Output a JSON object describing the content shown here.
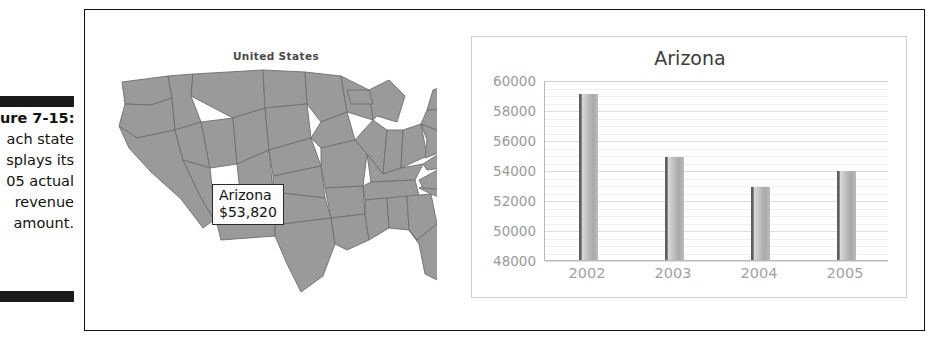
{
  "caption": {
    "lines": [
      "ure 7-15:",
      "ach state",
      "splays its",
      "05 actual",
      "revenue",
      "amount."
    ]
  },
  "map_panel": {
    "title": "United States",
    "callout": {
      "state": "Arizona",
      "value": "$53,820"
    },
    "fill_color": "#9a9a9a",
    "border_color": "#6e6e6e"
  },
  "chart_data": {
    "type": "bar",
    "title": "Arizona",
    "xlabel": "",
    "ylabel": "",
    "categories": [
      "2002",
      "2003",
      "2004",
      "2005"
    ],
    "values": [
      59100,
      54850,
      52850,
      53950
    ],
    "ylim": [
      48000,
      60000
    ],
    "yticks": [
      60000,
      58000,
      56000,
      54000,
      52000,
      50000,
      48000
    ],
    "ytick_labels": [
      "60000",
      "58000",
      "56000",
      "54000",
      "52000",
      "50000",
      "48000"
    ],
    "grid": true,
    "minor_grid_step": 500,
    "legend": "none",
    "bar_color": "#b4b4b4",
    "axis_color": "#b9b9b9",
    "tick_label_color": "#9a9a9a",
    "title_color": "#3b3b3b"
  }
}
